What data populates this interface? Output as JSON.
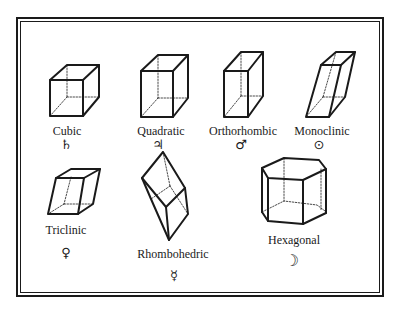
{
  "figure": {
    "page_mark": "",
    "items": [
      {
        "name": "Cubic",
        "symbol": "♄",
        "symbol_name": "saturn"
      },
      {
        "name": "Quadratic",
        "symbol": "♃",
        "symbol_name": "jupiter"
      },
      {
        "name": "Orthorhombic",
        "symbol": "♂",
        "symbol_name": "mars"
      },
      {
        "name": "Monoclinic",
        "symbol": "⊙",
        "symbol_name": "sun"
      },
      {
        "name": "Triclinic",
        "symbol": "♀",
        "symbol_name": "venus"
      },
      {
        "name": "Rhombohedric",
        "symbol": "☿",
        "symbol_name": "mercury"
      },
      {
        "name": "Hexagonal",
        "symbol": "☽",
        "symbol_name": "moon"
      }
    ]
  },
  "colors": {
    "ink": "#1a1a1a",
    "paper": "#ffffff"
  }
}
